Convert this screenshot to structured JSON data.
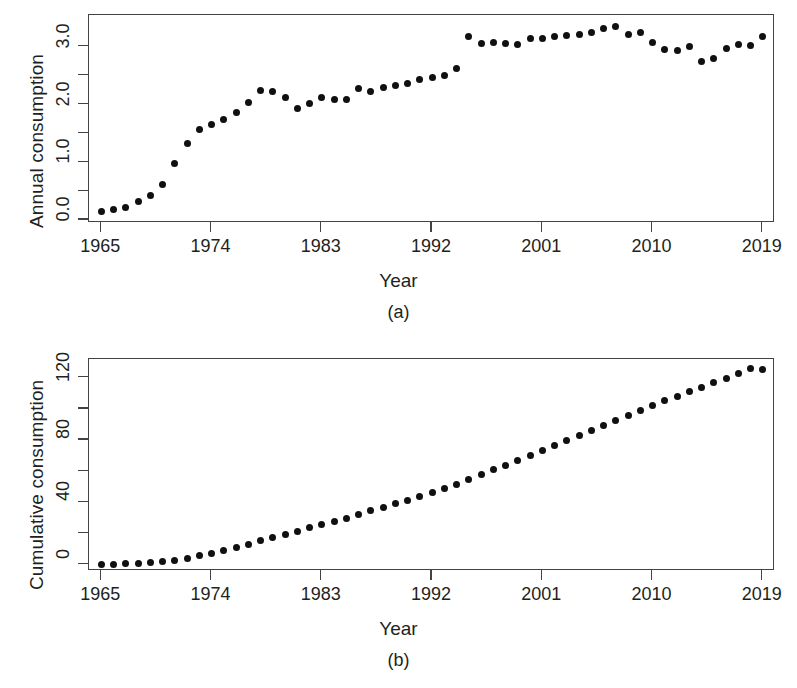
{
  "figure": {
    "panel_a_tag": "(a)",
    "panel_b_tag": "(b)"
  },
  "chart_data": [
    {
      "type": "scatter",
      "panel": "(a)",
      "title": "",
      "xlabel": "Year",
      "ylabel": "Annual consumption",
      "xlim": [
        1964.0,
        2020.0
      ],
      "ylim": [
        -0.05,
        3.55
      ],
      "grid": false,
      "legend": null,
      "xticks": [
        1965,
        1974,
        1983,
        1992,
        2001,
        2010,
        2019
      ],
      "xtick_labels": [
        "1965",
        "1974",
        "1983",
        "1992",
        "2001",
        "2010",
        "2019"
      ],
      "x_minor_ticks": [],
      "yticks": [
        0.0,
        0.5,
        1.0,
        1.5,
        2.0,
        2.5,
        3.0
      ],
      "ytick_labels": [
        "0.0",
        "",
        "1.0",
        "",
        "2.0",
        "",
        "3.0"
      ],
      "x": [
        1965,
        1966,
        1967,
        1968,
        1969,
        1970,
        1971,
        1972,
        1973,
        1974,
        1975,
        1976,
        1977,
        1978,
        1979,
        1980,
        1981,
        1982,
        1983,
        1984,
        1985,
        1986,
        1987,
        1988,
        1989,
        1990,
        1991,
        1992,
        1993,
        1994,
        1995,
        1996,
        1997,
        1998,
        1999,
        2000,
        2001,
        2002,
        2003,
        2004,
        2005,
        2006,
        2007,
        2008,
        2009,
        2010,
        2011,
        2012,
        2013,
        2014,
        2015,
        2016,
        2017,
        2018,
        2019
      ],
      "y": [
        0.15,
        0.18,
        0.22,
        0.32,
        0.42,
        0.62,
        0.98,
        1.32,
        1.57,
        1.65,
        1.74,
        1.87,
        2.03,
        2.25,
        2.22,
        2.13,
        1.93,
        2.02,
        2.13,
        2.09,
        2.08,
        2.27,
        2.22,
        2.3,
        2.33,
        2.37,
        2.43,
        2.47,
        2.5,
        2.62,
        3.18,
        3.06,
        3.08,
        3.06,
        3.04,
        3.14,
        3.15,
        3.18,
        3.19,
        3.22,
        3.25,
        3.31,
        3.35,
        3.22,
        3.24,
        3.07,
        2.95,
        2.93,
        3.0,
        2.74,
        2.8,
        2.97,
        3.04,
        3.02,
        3.18
      ]
    },
    {
      "type": "scatter",
      "panel": "(b)",
      "title": "",
      "xlabel": "Year",
      "ylabel": "Cumulative consumption",
      "xlim": [
        1964.0,
        2020.0
      ],
      "ylim": [
        -4.0,
        132.0
      ],
      "grid": false,
      "legend": null,
      "xticks": [
        1965,
        1974,
        1983,
        1992,
        2001,
        2010,
        2019
      ],
      "xtick_labels": [
        "1965",
        "1974",
        "1983",
        "1992",
        "2001",
        "2010",
        "2019"
      ],
      "yticks": [
        0,
        20,
        40,
        60,
        80,
        100,
        120
      ],
      "ytick_labels": [
        "0",
        "",
        "40",
        "",
        "80",
        "",
        "120"
      ],
      "x": [
        1965,
        1966,
        1967,
        1968,
        1969,
        1970,
        1971,
        1972,
        1973,
        1974,
        1975,
        1976,
        1977,
        1978,
        1979,
        1980,
        1981,
        1982,
        1983,
        1984,
        1985,
        1986,
        1987,
        1988,
        1989,
        1990,
        1991,
        1992,
        1993,
        1994,
        1995,
        1996,
        1997,
        1998,
        1999,
        2000,
        2001,
        2002,
        2003,
        2004,
        2005,
        2006,
        2007,
        2008,
        2009,
        2010,
        2011,
        2012,
        2013,
        2014,
        2015,
        2016,
        2017,
        2018,
        2019
      ],
      "y": [
        0.2,
        0.3,
        0.6,
        0.9,
        1.3,
        1.9,
        2.9,
        4.2,
        5.8,
        7.4,
        9.2,
        11.0,
        13.1,
        15.3,
        17.6,
        19.7,
        21.6,
        23.6,
        25.8,
        27.9,
        30.0,
        32.2,
        34.5,
        36.8,
        39.1,
        41.5,
        43.9,
        46.4,
        48.9,
        51.5,
        54.7,
        57.8,
        60.9,
        63.9,
        67.0,
        70.1,
        73.3,
        76.5,
        79.7,
        82.9,
        86.1,
        89.4,
        92.8,
        96.0,
        99.2,
        102.3,
        105.3,
        108.2,
        111.2,
        113.9,
        116.7,
        119.7,
        122.7,
        125.7,
        125.0
      ]
    }
  ]
}
